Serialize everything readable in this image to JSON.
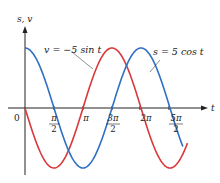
{
  "chart_data": {
    "type": "line",
    "title": "",
    "xlabel": "t",
    "ylabel": "s, v",
    "origin_label": "0",
    "x_ticks": [
      {
        "value": 1.5708,
        "num": "π",
        "den": "2"
      },
      {
        "value": 3.1416,
        "num": "π",
        "den": ""
      },
      {
        "value": 4.7124,
        "num": "3π",
        "den": "2"
      },
      {
        "value": 6.2832,
        "num": "2π",
        "den": "2"
      },
      {
        "value": 7.854,
        "num": "5π",
        "den": "2"
      }
    ],
    "x_tick_labels": [
      "π/2",
      "π",
      "3π/2",
      "2π",
      "5π/2"
    ],
    "xlim": [
      0,
      8.8
    ],
    "ylim": [
      -5,
      5
    ],
    "grid": false,
    "legend": "annotations",
    "series": [
      {
        "name": "v = −5 sin t",
        "formula": "-5*sin(t)",
        "color": "#d9383a",
        "t_end": 8.8,
        "x": [
          0,
          1.5708,
          3.1416,
          4.7124,
          6.2832,
          7.854,
          8.8
        ],
        "values": [
          0,
          -5,
          0,
          5,
          0,
          -5,
          -2.9
        ]
      },
      {
        "name": "s = 5 cos t",
        "formula": "5*cos(t)",
        "color": "#2f6fc4",
        "t_end": 8.55,
        "x": [
          0,
          1.5708,
          3.1416,
          4.7124,
          6.2832,
          7.854,
          8.55
        ],
        "values": [
          5,
          0,
          -5,
          0,
          5,
          0,
          -3.2
        ]
      }
    ],
    "annotations": [
      {
        "text": "v = −5 sin t",
        "series": 0
      },
      {
        "text": "s = 5 cos t",
        "series": 1
      }
    ]
  },
  "labels": {
    "y_axis": "s, v",
    "x_axis": "t",
    "origin": "0",
    "ann_v": "v = −5 sin t",
    "ann_s": "s = 5 cos t",
    "tick_pi_half_num": "π",
    "tick_pi_half_den": "2",
    "tick_pi": "π",
    "tick_3pi_half_num": "3π",
    "tick_3pi_half_den": "2",
    "tick_2pi": "2π",
    "tick_5pi_half_num": "5π",
    "tick_5pi_half_den": "2"
  }
}
